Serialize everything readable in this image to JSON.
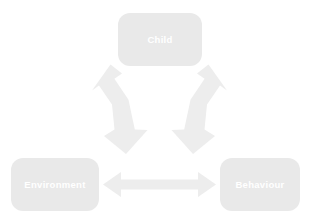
{
  "diagram": {
    "background_color": "#ffffff",
    "node_fill_color": "#e9e9e9",
    "node_label_color": "#ffffff",
    "arrow_fill_color": "#ededed",
    "nodes": [
      {
        "id": "child",
        "label": "Child"
      },
      {
        "id": "environment",
        "label": "Environment"
      },
      {
        "id": "behaviour",
        "label": "Behaviour"
      }
    ],
    "connectors": [
      {
        "id": "environment-child",
        "from": "Environment",
        "to": "Child",
        "style": "double-headed-arrow",
        "orientation": "diagonal-up-right"
      },
      {
        "id": "child-behaviour",
        "from": "Child",
        "to": "Behaviour",
        "style": "double-headed-arrow",
        "orientation": "diagonal-down-right"
      },
      {
        "id": "environment-behaviour",
        "from": "Environment",
        "to": "Behaviour",
        "style": "double-headed-arrow",
        "orientation": "horizontal"
      }
    ]
  }
}
